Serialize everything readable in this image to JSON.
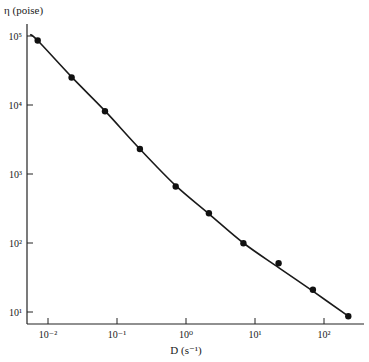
{
  "chart_data": {
    "type": "line",
    "title": "",
    "xlabel": "D (s⁻¹)",
    "ylabel": "η (poise)",
    "xscale": "log",
    "yscale": "log",
    "xlim": [
      0.005,
      500
    ],
    "ylim": [
      7,
      120000
    ],
    "x_ticks": [
      0.01,
      0.1,
      1,
      10,
      100
    ],
    "x_tick_labels": [
      "10⁻²",
      "10⁻¹",
      "10⁰",
      "10¹",
      "10²"
    ],
    "y_ticks": [
      10,
      100,
      1000,
      10000,
      100000
    ],
    "y_tick_labels": [
      "10¹",
      "10²",
      "10³",
      "10⁴",
      "10⁵"
    ],
    "grid": false,
    "legend": null,
    "series": [
      {
        "name": "measured",
        "style": "points",
        "x": [
          0.0071,
          0.022,
          0.067,
          0.215,
          0.71,
          2.15,
          6.8,
          22,
          69,
          225
        ],
        "y": [
          86000,
          25000,
          8100,
          2300,
          660,
          270,
          99,
          51,
          21,
          8.7
        ]
      },
      {
        "name": "fit curve",
        "style": "line",
        "x": [
          0.0055,
          0.0071,
          0.022,
          0.067,
          0.215,
          0.71,
          2.15,
          6.8,
          22,
          69,
          225
        ],
        "y": [
          105000,
          86000,
          25500,
          8200,
          2300,
          680,
          265,
          100,
          44,
          20,
          8.7
        ]
      }
    ]
  }
}
